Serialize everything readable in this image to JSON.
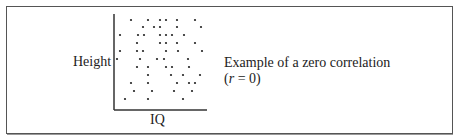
{
  "diagram": {
    "y_axis_label": "Height",
    "x_axis_label": "IQ",
    "caption_line1": "Example of a zero  correlation",
    "caption_line2_prefix": "(",
    "caption_line2_var": "r",
    "caption_line2_suffix": " = 0)"
  },
  "chart_data": {
    "type": "scatter",
    "title": "Example of a zero correlation (r = 0)",
    "xlabel": "IQ",
    "ylabel": "Height",
    "grid": false,
    "points_px": [
      [
        131,
        20
      ],
      [
        148,
        20
      ],
      [
        160,
        20
      ],
      [
        166,
        20
      ],
      [
        177,
        20
      ],
      [
        195,
        20
      ],
      [
        143,
        27
      ],
      [
        154,
        27
      ],
      [
        160,
        27
      ],
      [
        177,
        27
      ],
      [
        201,
        27
      ],
      [
        120,
        35
      ],
      [
        138,
        35
      ],
      [
        144,
        35
      ],
      [
        160,
        35
      ],
      [
        166,
        35
      ],
      [
        172,
        35
      ],
      [
        184,
        35
      ],
      [
        137,
        43
      ],
      [
        160,
        43
      ],
      [
        166,
        43
      ],
      [
        177,
        43
      ],
      [
        195,
        43
      ],
      [
        120,
        51
      ],
      [
        137,
        51
      ],
      [
        143,
        51
      ],
      [
        166,
        51
      ],
      [
        178,
        51
      ],
      [
        202,
        51
      ],
      [
        117,
        59
      ],
      [
        140,
        59
      ],
      [
        157,
        59
      ],
      [
        164,
        59
      ],
      [
        188,
        59
      ],
      [
        137,
        67
      ],
      [
        148,
        67
      ],
      [
        166,
        67
      ],
      [
        172,
        67
      ],
      [
        189,
        67
      ],
      [
        148,
        75
      ],
      [
        171,
        75
      ],
      [
        183,
        75
      ],
      [
        200,
        75
      ],
      [
        131,
        83
      ],
      [
        148,
        83
      ],
      [
        177,
        83
      ],
      [
        189,
        83
      ],
      [
        195,
        83
      ],
      [
        134,
        91
      ],
      [
        152,
        91
      ],
      [
        174,
        91
      ],
      [
        192,
        91
      ],
      [
        125,
        99
      ],
      [
        148,
        99
      ],
      [
        183,
        99
      ]
    ],
    "correlation": 0
  }
}
